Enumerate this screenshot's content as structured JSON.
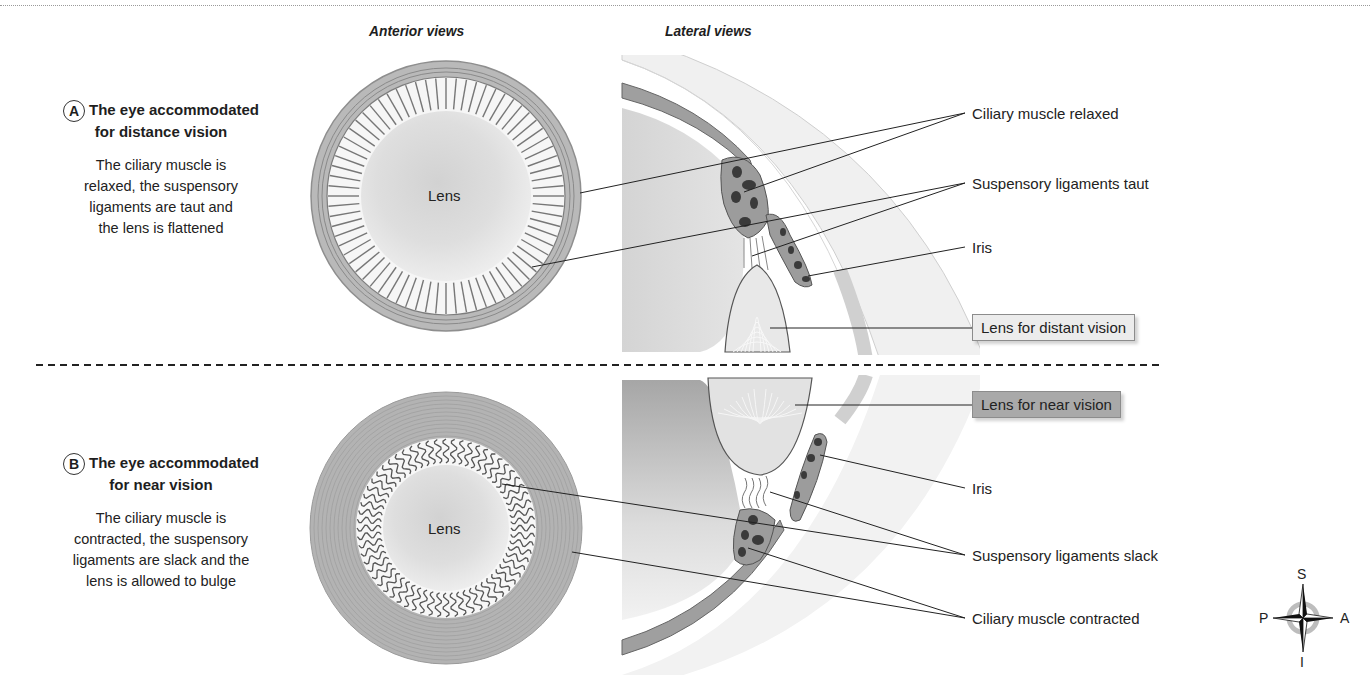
{
  "headers": {
    "anterior": "Anterior views",
    "lateral": "Lateral views"
  },
  "panels": [
    {
      "badge": "A",
      "title_line1": "The eye accommodated",
      "title_line2": "for distance vision",
      "description": [
        "The ciliary muscle is",
        "relaxed, the suspensory",
        "ligaments are taut and",
        "the lens is flattened"
      ],
      "lens_label": "Lens",
      "labels": {
        "ciliary": "Ciliary muscle relaxed",
        "ligaments": "Suspensory ligaments taut",
        "iris": "Iris",
        "lens_box": "Lens for distant vision"
      },
      "lens_box_color": "#ececec"
    },
    {
      "badge": "B",
      "title_line1": "The eye accommodated",
      "title_line2": "for near vision",
      "description": [
        "The ciliary muscle is",
        "contracted, the suspensory",
        "ligaments are slack and the",
        "lens is allowed to bulge"
      ],
      "lens_label": "Lens",
      "labels": {
        "lens_box": "Lens for near vision",
        "iris": "Iris",
        "ligaments": "Suspensory ligaments slack",
        "ciliary": "Ciliary muscle contracted"
      },
      "lens_box_color": "#a9a9a9"
    }
  ],
  "compass": {
    "top": "S",
    "bottom": "I",
    "left": "P",
    "right": "A"
  },
  "colors": {
    "muscle_gray": "#9b9b9b",
    "dark_fill": "#3a3a3a",
    "light_gray": "#e6e6e6"
  }
}
